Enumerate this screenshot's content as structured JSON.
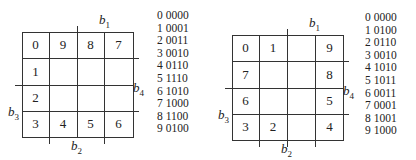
{
  "diagrams": [
    {
      "id": "left",
      "grid": [
        [
          "0",
          "9",
          "8",
          "7"
        ],
        [
          "1",
          "",
          "",
          ""
        ],
        [
          "2",
          "",
          "",
          ""
        ],
        [
          "3",
          "4",
          "5",
          "6"
        ]
      ],
      "labels": {
        "b1": "b",
        "b1_sub": "1",
        "b2": "b",
        "b2_sub": "2",
        "b3": "b",
        "b3_sub": "3",
        "b4": "b",
        "b4_sub": "4"
      },
      "codes": [
        {
          "digit": "0",
          "code": "0000"
        },
        {
          "digit": "1",
          "code": "0001"
        },
        {
          "digit": "2",
          "code": "0011"
        },
        {
          "digit": "3",
          "code": "0010"
        },
        {
          "digit": "4",
          "code": "0110"
        },
        {
          "digit": "5",
          "code": "1110"
        },
        {
          "digit": "6",
          "code": "1010"
        },
        {
          "digit": "7",
          "code": "1000"
        },
        {
          "digit": "8",
          "code": "1100"
        },
        {
          "digit": "9",
          "code": "0100"
        }
      ]
    },
    {
      "id": "right",
      "grid": [
        [
          "0",
          "1",
          "",
          "9"
        ],
        [
          "7",
          "",
          "",
          "8"
        ],
        [
          "6",
          "",
          "",
          "5"
        ],
        [
          "3",
          "2",
          "",
          "4"
        ]
      ],
      "labels": {
        "b1": "b",
        "b1_sub": "1",
        "b2": "b",
        "b2_sub": "2",
        "b3": "b",
        "b3_sub": "3",
        "b4": "b",
        "b4_sub": "4"
      },
      "codes": [
        {
          "digit": "0",
          "code": "0000"
        },
        {
          "digit": "1",
          "code": "0100"
        },
        {
          "digit": "2",
          "code": "0110"
        },
        {
          "digit": "3",
          "code": "0010"
        },
        {
          "digit": "4",
          "code": "1010"
        },
        {
          "digit": "5",
          "code": "1011"
        },
        {
          "digit": "6",
          "code": "0011"
        },
        {
          "digit": "7",
          "code": "0001"
        },
        {
          "digit": "8",
          "code": "1001"
        },
        {
          "digit": "9",
          "code": "1000"
        }
      ]
    }
  ]
}
